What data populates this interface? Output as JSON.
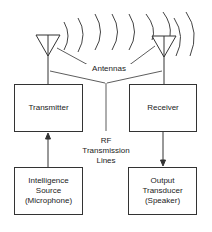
{
  "diagram": {
    "type": "radio communication system block diagram",
    "labels": {
      "antennas": "Antennas",
      "rf_lines": [
        "RF",
        "Transmission",
        "Lines"
      ]
    },
    "blocks": {
      "transmitter": {
        "lines": [
          "Transmitter"
        ]
      },
      "receiver": {
        "lines": [
          "Receiver"
        ]
      },
      "source": {
        "lines": [
          "Intelligence",
          "Source",
          "(Microphone)"
        ]
      },
      "output": {
        "lines": [
          "Output",
          "Transducer",
          "(Speaker)"
        ]
      }
    },
    "connections": [
      {
        "from": "Intelligence Source (Microphone)",
        "to": "Transmitter",
        "arrow": "up"
      },
      {
        "from": "Receiver",
        "to": "Output Transducer (Speaker)",
        "arrow": "down"
      },
      {
        "from": "Transmitter",
        "to": "Transmitter Antenna"
      },
      {
        "from": "Receiver Antenna",
        "to": "Receiver"
      }
    ],
    "colors": {
      "stroke": "#333333",
      "background": "#ffffff"
    }
  }
}
